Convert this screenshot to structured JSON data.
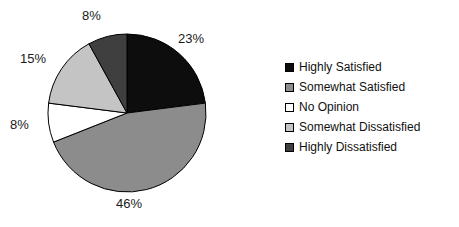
{
  "chart_data": {
    "type": "pie",
    "title": "",
    "subtitle": "",
    "xlabel": "",
    "ylabel": "",
    "grid": false,
    "legend_position": "right",
    "start_angle_deg": 0,
    "direction": "clockwise",
    "categories": [
      "Highly Satisfied",
      "Somewhat Satisfied",
      "No Opinion",
      "Somewhat Dissatisfied",
      "Highly Dissatisfied"
    ],
    "values": [
      23,
      46,
      8,
      15,
      8
    ],
    "data_labels": [
      "23%",
      "46%",
      "8%",
      "15%",
      "8%"
    ],
    "colors": [
      "#0d0d0d",
      "#8c8c8c",
      "#ffffff",
      "#c4c4c4",
      "#3f3f3f"
    ],
    "slice_border_color": "#000000",
    "units": "percent"
  },
  "pie": {
    "center_x": 127,
    "center_y": 113,
    "radius": 79,
    "slices": [
      {
        "label": "Highly Satisfied",
        "percent": 23,
        "text": "23%",
        "color": "#0d0d0d"
      },
      {
        "label": "Somewhat Satisfied",
        "percent": 46,
        "text": "46%",
        "color": "#8c8c8c"
      },
      {
        "label": "No Opinion",
        "percent": 8,
        "text": "8%",
        "color": "#ffffff"
      },
      {
        "label": "Somewhat Dissatisfied",
        "percent": 15,
        "text": "15%",
        "color": "#c4c4c4"
      },
      {
        "label": "Highly Dissatisfied",
        "percent": 8,
        "text": "8%",
        "color": "#3f3f3f"
      }
    ]
  },
  "legend": {
    "items": [
      {
        "label": "Highly Satisfied",
        "color": "#0d0d0d"
      },
      {
        "label": "Somewhat Satisfied",
        "color": "#8c8c8c"
      },
      {
        "label": "No Opinion",
        "color": "#ffffff"
      },
      {
        "label": "Somewhat Dissatisfied",
        "color": "#c4c4c4"
      },
      {
        "label": "Highly Dissatisfied",
        "color": "#3f3f3f"
      }
    ]
  }
}
